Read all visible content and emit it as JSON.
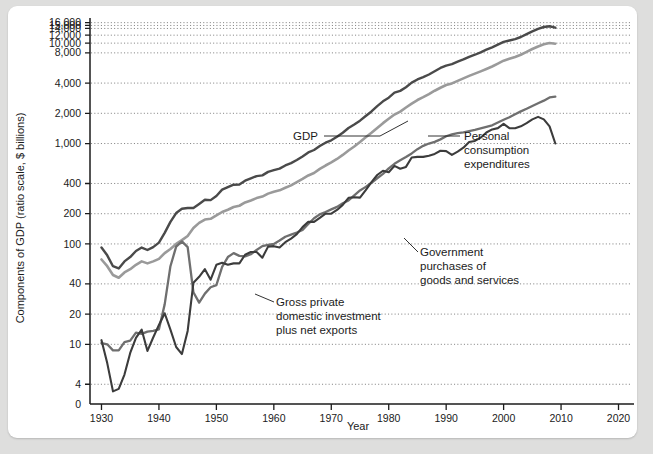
{
  "figure": {
    "background_color": "#dededd",
    "card_color": "#ffffff"
  },
  "chart_data": {
    "type": "line",
    "title": "",
    "xlabel": "Year",
    "ylabel": "Components of GDP (ratio scale, $ billions)",
    "scale": "log",
    "grid": true,
    "legend_position": "inline-annotations",
    "xlim": [
      1928,
      2022
    ],
    "ylim": [
      3.2,
      17000
    ],
    "xticks": [
      1930,
      1940,
      1950,
      1960,
      1970,
      1980,
      1990,
      2000,
      2010,
      2020
    ],
    "xtick_labels": [
      "1930",
      "1940",
      "1950",
      "1960",
      "1970",
      "1980",
      "1990",
      "2000",
      "2010",
      "2020"
    ],
    "yticks": [
      4,
      10,
      20,
      40,
      100,
      200,
      400,
      1000,
      2000,
      4000,
      8000,
      10000,
      12000,
      14000,
      15000,
      16000
    ],
    "ytick_labels": [
      "4",
      "10",
      "20",
      "40",
      "100",
      "200",
      "400",
      "1,000",
      "2,000",
      "4,000",
      "8,000",
      "10,000",
      "12,000",
      "14,000",
      "15,000",
      "16,000"
    ],
    "ybaseline_label": "0",
    "series": [
      {
        "name": "GDP",
        "color": "#4a4a4a",
        "width": 2.4,
        "x": [
          1930,
          1931,
          1932,
          1933,
          1934,
          1935,
          1936,
          1937,
          1938,
          1939,
          1940,
          1941,
          1942,
          1943,
          1944,
          1945,
          1946,
          1947,
          1948,
          1949,
          1950,
          1951,
          1952,
          1953,
          1954,
          1955,
          1956,
          1957,
          1958,
          1959,
          1960,
          1961,
          1962,
          1963,
          1964,
          1965,
          1966,
          1967,
          1968,
          1969,
          1970,
          1971,
          1972,
          1973,
          1974,
          1975,
          1976,
          1977,
          1978,
          1979,
          1980,
          1981,
          1982,
          1983,
          1984,
          1985,
          1986,
          1987,
          1988,
          1989,
          1990,
          1991,
          1992,
          1993,
          1994,
          1995,
          1996,
          1997,
          1998,
          1999,
          2000,
          2001,
          2002,
          2003,
          2004,
          2005,
          2006,
          2007,
          2008,
          2009
        ],
        "y": [
          92,
          77,
          60,
          57,
          67,
          74,
          85,
          92,
          87,
          93,
          103,
          129,
          166,
          203,
          224,
          228,
          228,
          250,
          275,
          273,
          300,
          347,
          368,
          389,
          391,
          427,
          450,
          474,
          482,
          522,
          543,
          563,
          605,
          638,
          685,
          743,
          815,
          862,
          943,
          1020,
          1076,
          1168,
          1282,
          1429,
          1549,
          1689,
          1878,
          2086,
          2357,
          2632,
          2863,
          3211,
          3345,
          3638,
          4041,
          4347,
          4590,
          4870,
          5253,
          5658,
          5980,
          6174,
          6539,
          6879,
          7309,
          7664,
          8100,
          8609,
          9089,
          9661,
          10285,
          10622,
          10978,
          11511,
          12275,
          13094,
          13856,
          14478,
          14719,
          14256
        ]
      },
      {
        "name": "Personal consumption expenditures",
        "color": "#9a9a9a",
        "width": 2.6,
        "x": [
          1930,
          1931,
          1932,
          1933,
          1934,
          1935,
          1936,
          1937,
          1938,
          1939,
          1940,
          1941,
          1942,
          1943,
          1944,
          1945,
          1946,
          1947,
          1948,
          1949,
          1950,
          1951,
          1952,
          1953,
          1954,
          1955,
          1956,
          1957,
          1958,
          1959,
          1960,
          1961,
          1962,
          1963,
          1964,
          1965,
          1966,
          1967,
          1968,
          1969,
          1970,
          1971,
          1972,
          1973,
          1974,
          1975,
          1976,
          1977,
          1978,
          1979,
          1980,
          1981,
          1982,
          1983,
          1984,
          1985,
          1986,
          1987,
          1988,
          1989,
          1990,
          1991,
          1992,
          1993,
          1994,
          1995,
          1996,
          1997,
          1998,
          1999,
          2000,
          2001,
          2002,
          2003,
          2004,
          2005,
          2006,
          2007,
          2008,
          2009
        ],
        "y": [
          70,
          60,
          49,
          46,
          52,
          56,
          62,
          67,
          64,
          67,
          71,
          81,
          89,
          100,
          109,
          120,
          144,
          162,
          175,
          178,
          192,
          208,
          219,
          233,
          240,
          259,
          271,
          286,
          296,
          317,
          331,
          342,
          363,
          383,
          412,
          444,
          481,
          509,
          559,
          604,
          648,
          702,
          770,
          852,
          933,
          1034,
          1152,
          1278,
          1430,
          1596,
          1762,
          1944,
          2079,
          2286,
          2498,
          2712,
          2895,
          3105,
          3356,
          3596,
          3831,
          3971,
          4209,
          4455,
          4716,
          4969,
          5237,
          5529,
          5850,
          6246,
          6683,
          6987,
          7289,
          7669,
          8170,
          8742,
          9268,
          9729,
          10015,
          9866
        ]
      },
      {
        "name": "Government purchases of goods and services",
        "color": "#6f6f6f",
        "width": 2.3,
        "x": [
          1930,
          1931,
          1932,
          1933,
          1934,
          1935,
          1936,
          1937,
          1938,
          1939,
          1940,
          1941,
          1942,
          1943,
          1944,
          1945,
          1946,
          1947,
          1948,
          1949,
          1950,
          1951,
          1952,
          1953,
          1954,
          1955,
          1956,
          1957,
          1958,
          1959,
          1960,
          1961,
          1962,
          1963,
          1964,
          1965,
          1966,
          1967,
          1968,
          1969,
          1970,
          1971,
          1972,
          1973,
          1974,
          1975,
          1976,
          1977,
          1978,
          1979,
          1980,
          1981,
          1982,
          1983,
          1984,
          1985,
          1986,
          1987,
          1988,
          1989,
          1990,
          1991,
          1992,
          1993,
          1994,
          1995,
          1996,
          1997,
          1998,
          1999,
          2000,
          2001,
          2002,
          2003,
          2004,
          2005,
          2006,
          2007,
          2008,
          2009
        ],
        "y": [
          10.3,
          10.0,
          8.7,
          8.7,
          10.5,
          10.9,
          13.1,
          12.7,
          13.4,
          13.6,
          14.1,
          25.0,
          60.0,
          94.0,
          106.0,
          93.0,
          33.0,
          26.0,
          32.0,
          37.0,
          38.8,
          59.0,
          74.0,
          81.0,
          76.0,
          75.0,
          79.0,
          87.0,
          95.0,
          98.0,
          100.0,
          108.0,
          118.0,
          124.0,
          130.0,
          138.0,
          158.0,
          180.0,
          197.0,
          208.0,
          221.0,
          234.0,
          254.0,
          271.0,
          305.0,
          341.0,
          370.0,
          407.0,
          451.0,
          499.0,
          566.0,
          628.0,
          680.0,
          733.0,
          797.0,
          879.0,
          949.0,
          1000.0,
          1039.0,
          1100.0,
          1181.0,
          1236.0,
          1271.0,
          1292.0,
          1328.0,
          1369.0,
          1416.0,
          1468.0,
          1518.0,
          1620.0,
          1722.0,
          1825.0,
          1961.0,
          2092.0,
          2217.0,
          2369.0,
          2519.0,
          2674.0,
          2878.0,
          2931.0
        ]
      },
      {
        "name": "Gross private domestic investment plus net exports",
        "color": "#3c3c3c",
        "width": 2.1,
        "x": [
          1930,
          1931,
          1932,
          1933,
          1934,
          1935,
          1936,
          1937,
          1938,
          1939,
          1940,
          1941,
          1942,
          1943,
          1944,
          1945,
          1946,
          1947,
          1948,
          1949,
          1950,
          1951,
          1952,
          1953,
          1954,
          1955,
          1956,
          1957,
          1958,
          1959,
          1960,
          1961,
          1962,
          1963,
          1964,
          1965,
          1966,
          1967,
          1968,
          1969,
          1970,
          1971,
          1972,
          1973,
          1974,
          1975,
          1976,
          1977,
          1978,
          1979,
          1980,
          1981,
          1982,
          1983,
          1984,
          1985,
          1986,
          1987,
          1988,
          1989,
          1990,
          1991,
          1992,
          1993,
          1994,
          1995,
          1996,
          1997,
          1998,
          1999,
          2000,
          2001,
          2002,
          2003,
          2004,
          2005,
          2006,
          2007,
          2008,
          2009
        ],
        "y": [
          11.0,
          6.5,
          3.4,
          3.6,
          5.0,
          8.2,
          11.6,
          14.0,
          8.6,
          11.7,
          15.6,
          20.4,
          14.0,
          9.4,
          8.0,
          13.6,
          41.0,
          47.0,
          56.0,
          44.0,
          62.0,
          65.0,
          62.0,
          64.0,
          64.0,
          78.0,
          83.0,
          83.0,
          73.0,
          94.0,
          95.0,
          92.0,
          104.0,
          113.0,
          125.0,
          147.0,
          166.0,
          166.0,
          182.0,
          200.0,
          200.0,
          218.0,
          245.0,
          288.0,
          292.0,
          289.0,
          343.0,
          412.0,
          486.0,
          536.0,
          518.0,
          599.0,
          561.0,
          585.0,
          725.0,
          737.0,
          736.0,
          757.0,
          788.0,
          847.0,
          840.0,
          770.0,
          831.0,
          909.0,
          1037.0,
          1061.0,
          1144.0,
          1287.0,
          1382.0,
          1424.0,
          1571.0,
          1422.0,
          1420.0,
          1485.0,
          1600.0,
          1740.0,
          1844.0,
          1740.0,
          1480.0,
          1000.0
        ]
      }
    ],
    "annotations": [
      {
        "id": "gdp",
        "label_lines": [
          "GDP"
        ],
        "text_x": 310,
        "text_y": 134,
        "anchor": "end",
        "leader": [
          [
            316,
            130
          ],
          [
            372,
            130
          ],
          [
            400,
            115
          ]
        ]
      },
      {
        "id": "personal-consumption-expenditures",
        "label_lines": [
          "Personal",
          "consumption",
          "expenditures"
        ],
        "text_x": 456,
        "text_y": 134,
        "anchor": "start",
        "leader": [
          [
            452,
            130
          ],
          [
            420,
            130
          ]
        ]
      },
      {
        "id": "government-purchases",
        "label_lines": [
          "Government",
          "purchases of",
          "goods and services"
        ],
        "text_x": 412,
        "text_y": 250,
        "anchor": "start",
        "leader": [
          [
            410,
            246
          ],
          [
            396,
            232
          ]
        ]
      },
      {
        "id": "gross-private-domestic-investment",
        "label_lines": [
          "Gross private",
          "domestic investment",
          "plus net exports"
        ],
        "text_x": 268,
        "text_y": 300,
        "anchor": "start",
        "leader": [
          [
            266,
            296
          ],
          [
            247,
            288
          ]
        ]
      }
    ]
  }
}
